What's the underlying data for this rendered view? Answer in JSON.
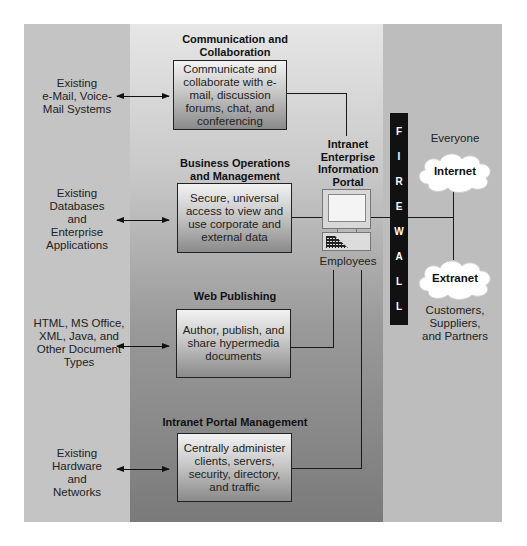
{
  "title": "Intranet Enterprise Information Portal",
  "sources": [
    {
      "label": "Existing e-Mail, Voice-Mail Systems"
    },
    {
      "label": "Existing Databases and Enterprise Applications"
    },
    {
      "label": "HTML, MS Office, XML, Java, and Other Document Types"
    },
    {
      "label": "Existing Hardware and Networks"
    }
  ],
  "sources_lines": [
    [
      "Existing",
      "e-Mail, Voice-",
      "Mail Systems"
    ],
    [
      "Existing",
      "Databases",
      "and",
      "Enterprise",
      "Applications"
    ],
    [
      "HTML, MS Office,",
      "XML, Java, and",
      "Other Document",
      "Types"
    ],
    [
      "Existing",
      "Hardware",
      "and",
      "Networks"
    ]
  ],
  "functions": [
    {
      "title": "Communication and Collaboration",
      "title_lines": [
        "Communication and",
        "Collaboration"
      ],
      "description": "Communicate and collaborate with e-mail, discussion forums, chat, and conferencing"
    },
    {
      "title": "Business Operations and Management",
      "title_lines": [
        "Business Operations",
        "and Management"
      ],
      "description": "Secure, universal access to view and use corporate and external data"
    },
    {
      "title": "Web Publishing",
      "title_lines": [
        "Web Publishing"
      ],
      "description": "Author, publish, and share hypermedia documents"
    },
    {
      "title": "Intranet Portal Management",
      "title_lines": [
        "Intranet Portal Management"
      ],
      "description": "Centrally administer clients, servers, security, directory, and traffic"
    }
  ],
  "portal": {
    "label_lines": [
      "Intranet",
      "Enterprise",
      "Information",
      "Portal"
    ],
    "users_label": "Employees",
    "icon": "desktop-computer-icon"
  },
  "firewall": {
    "label": "FIREWALL",
    "letters": [
      "F",
      "I",
      "R",
      "E",
      "W",
      "A",
      "L",
      "L"
    ]
  },
  "networks": {
    "internet": {
      "label": "Internet",
      "audience": "Everyone",
      "icon": "cloud-icon"
    },
    "extranet": {
      "label": "Extranet",
      "audience_lines": [
        "Customers,",
        "Suppliers,",
        "and Partners"
      ],
      "icon": "cloud-icon"
    }
  },
  "colors": {
    "left_panel": "#c4c4c4",
    "right_panel": "#bdbdbd",
    "middle_panel_top": "#e6e6e6",
    "middle_panel_bottom": "#7a7a7a",
    "firewall": "#111111",
    "lines": "#1a1a1a"
  }
}
